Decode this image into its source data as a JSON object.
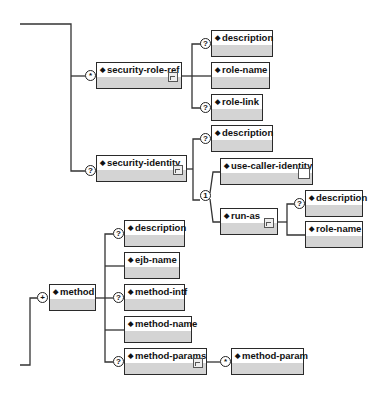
{
  "diagram": {
    "type": "xml-schema-tree",
    "nodes": [
      {
        "id": "security-role-ref",
        "label": "security-role-ref",
        "cardinality": "*",
        "has_children_icon": true
      },
      {
        "id": "srr-description",
        "label": "description",
        "cardinality": "?"
      },
      {
        "id": "srr-role-name",
        "label": "role-name",
        "cardinality": ""
      },
      {
        "id": "srr-role-link",
        "label": "role-link",
        "cardinality": "?"
      },
      {
        "id": "security-identity",
        "label": "security-identity",
        "cardinality": "?",
        "has_children_icon": true
      },
      {
        "id": "si-description",
        "label": "description",
        "cardinality": "?"
      },
      {
        "id": "si-choice",
        "label": "1",
        "cardinality": "1"
      },
      {
        "id": "use-caller-identity",
        "label": "use-caller-identity",
        "cardinality": "",
        "empty_icon": true
      },
      {
        "id": "run-as",
        "label": "run-as",
        "cardinality": "",
        "has_children_icon": true
      },
      {
        "id": "ra-description",
        "label": "description",
        "cardinality": "?"
      },
      {
        "id": "ra-role-name",
        "label": "role-name",
        "cardinality": ""
      },
      {
        "id": "method",
        "label": "method",
        "cardinality": "+"
      },
      {
        "id": "m-description",
        "label": "description",
        "cardinality": "?"
      },
      {
        "id": "m-ejb-name",
        "label": "ejb-name",
        "cardinality": ""
      },
      {
        "id": "m-method-intf",
        "label": "method-intf",
        "cardinality": "?"
      },
      {
        "id": "m-method-name",
        "label": "method-name",
        "cardinality": ""
      },
      {
        "id": "m-method-params",
        "label": "method-params",
        "cardinality": "?",
        "has_children_icon": true
      },
      {
        "id": "m-method-param",
        "label": "method-param",
        "cardinality": "*"
      }
    ],
    "cardinality_symbols": {
      "optional": "?",
      "zero_or_more": "*",
      "one_or_more": "+",
      "choice": "1"
    },
    "colors": {
      "border": "#2a2a2a",
      "body_fill": "#d4d4d4",
      "line": "#333333"
    }
  },
  "labels": {
    "security_role_ref": "security-role-ref",
    "srr_description": "description",
    "srr_role_name": "role-name",
    "srr_role_link": "role-link",
    "security_identity": "security-identity",
    "si_description": "description",
    "use_caller_identity": "use-caller-identity",
    "run_as": "run-as",
    "ra_description": "description",
    "ra_role_name": "role-name",
    "method": "method",
    "m_description": "description",
    "m_ejb_name": "ejb-name",
    "m_method_intf": "method-intf",
    "m_method_name": "method-name",
    "m_method_params": "method-params",
    "m_method_param": "method-param"
  },
  "cards": {
    "star": "*",
    "optional": "?",
    "plus": "+",
    "one": "1"
  },
  "diamond": "◆"
}
